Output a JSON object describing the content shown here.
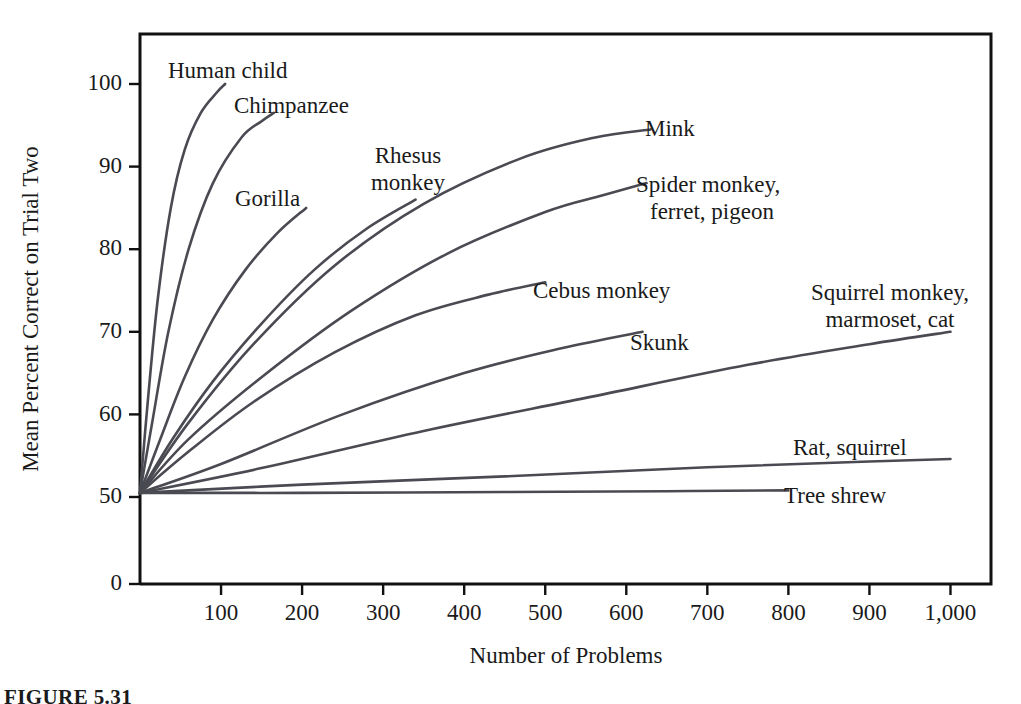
{
  "caption": "FIGURE 5.31",
  "chart_data": {
    "type": "line",
    "title": "",
    "xlabel": "Number of Problems",
    "ylabel": "Mean Percent Correct on Trial Two",
    "xlim": [
      0,
      1050
    ],
    "ylim": [
      0,
      103
    ],
    "grid": false,
    "legend_position": "inline-curve-labels",
    "x_ticks": [
      100,
      200,
      300,
      400,
      500,
      600,
      700,
      800,
      900,
      1000
    ],
    "x_tick_labels": [
      "100",
      "200",
      "300",
      "400",
      "500",
      "600",
      "700",
      "800",
      "900",
      "1,000"
    ],
    "y_ticks": [
      0,
      50,
      60,
      70,
      80,
      90,
      100
    ],
    "y_tick_labels": [
      "0",
      "50",
      "60",
      "70",
      "80",
      "90",
      "100"
    ],
    "common_origin": {
      "x": 0,
      "y": 50.5
    },
    "series": [
      {
        "name": "Human child",
        "label": "Human child",
        "label_lines": [
          "Human child"
        ],
        "label_anchor": "start",
        "label_x": 168,
        "label_y": 78,
        "points": [
          [
            0,
            50.5
          ],
          [
            10,
            62
          ],
          [
            22,
            74
          ],
          [
            38,
            85
          ],
          [
            55,
            92
          ],
          [
            75,
            96.5
          ],
          [
            95,
            99
          ],
          [
            105,
            100
          ]
        ]
      },
      {
        "name": "Chimpanzee",
        "label": "Chimpanzee",
        "label_lines": [
          "Chimpanzee"
        ],
        "label_anchor": "start",
        "label_x": 234,
        "label_y": 113,
        "points": [
          [
            0,
            50.5
          ],
          [
            15,
            59
          ],
          [
            35,
            70
          ],
          [
            60,
            80
          ],
          [
            90,
            88
          ],
          [
            125,
            93.5
          ],
          [
            150,
            95.5
          ],
          [
            165,
            96.5
          ]
        ]
      },
      {
        "name": "Gorilla",
        "label": "Gorilla",
        "label_lines": [
          "Gorilla"
        ],
        "label_anchor": "start",
        "label_x": 235,
        "label_y": 206,
        "points": [
          [
            0,
            50.5
          ],
          [
            25,
            57
          ],
          [
            55,
            64.5
          ],
          [
            90,
            71.5
          ],
          [
            130,
            77.5
          ],
          [
            170,
            82
          ],
          [
            205,
            85
          ]
        ]
      },
      {
        "name": "Rhesus monkey",
        "label": "Rhesus monkey",
        "label_lines": [
          "Rhesus",
          "monkey"
        ],
        "label_anchor": "middle",
        "label_x": 408,
        "label_y": 163,
        "points": [
          [
            0,
            50.5
          ],
          [
            40,
            57
          ],
          [
            90,
            64
          ],
          [
            150,
            71
          ],
          [
            215,
            77.5
          ],
          [
            280,
            82.5
          ],
          [
            340,
            86
          ]
        ]
      },
      {
        "name": "Mink",
        "label": "Mink",
        "label_lines": [
          "Mink"
        ],
        "label_anchor": "start",
        "label_x": 645,
        "label_y": 136,
        "points": [
          [
            0,
            50.5
          ],
          [
            60,
            59
          ],
          [
            140,
            68.5
          ],
          [
            240,
            78
          ],
          [
            350,
            85.5
          ],
          [
            470,
            91
          ],
          [
            560,
            93.5
          ],
          [
            630,
            94.5
          ]
        ]
      },
      {
        "name": "Spider monkey, ferret, pigeon",
        "label": "Spider monkey, ferret, pigeon",
        "label_lines": [
          "Spider monkey,",
          "ferret, pigeon"
        ],
        "label_anchor": "start",
        "label_x": 636,
        "label_y": 192,
        "points": [
          [
            0,
            50.5
          ],
          [
            60,
            57
          ],
          [
            150,
            64.5
          ],
          [
            260,
            72.5
          ],
          [
            380,
            79.5
          ],
          [
            500,
            84.5
          ],
          [
            570,
            86.5
          ],
          [
            625,
            88
          ]
        ]
      },
      {
        "name": "Cebus monkey",
        "label": "Cebus monkey",
        "label_lines": [
          "Cebus monkey"
        ],
        "label_anchor": "start",
        "label_x": 533,
        "label_y": 298,
        "points": [
          [
            0,
            50.5
          ],
          [
            60,
            55.5
          ],
          [
            140,
            61.5
          ],
          [
            240,
            67.5
          ],
          [
            340,
            72
          ],
          [
            430,
            74.5
          ],
          [
            500,
            76
          ]
        ]
      },
      {
        "name": "Skunk",
        "label": "Skunk",
        "label_lines": [
          "Skunk"
        ],
        "label_anchor": "start",
        "label_x": 630,
        "label_y": 350,
        "points": [
          [
            0,
            50.5
          ],
          [
            100,
            54
          ],
          [
            250,
            60
          ],
          [
            400,
            65
          ],
          [
            520,
            68
          ],
          [
            620,
            70
          ]
        ]
      },
      {
        "name": "Squirrel monkey, marmoset, cat",
        "label": "Squirrel monkey, marmoset, cat",
        "label_lines": [
          "Squirrel monkey,",
          "marmoset, cat"
        ],
        "label_anchor": "middle",
        "label_x": 890,
        "label_y": 300,
        "points": [
          [
            0,
            50.5
          ],
          [
            150,
            53.5
          ],
          [
            350,
            58
          ],
          [
            550,
            62
          ],
          [
            750,
            66
          ],
          [
            900,
            68.5
          ],
          [
            1000,
            70
          ]
        ]
      },
      {
        "name": "Rat, squirrel",
        "label": "Rat, squirrel",
        "label_lines": [
          "Rat, squirrel"
        ],
        "label_anchor": "start",
        "label_x": 793,
        "label_y": 455,
        "points": [
          [
            0,
            50.5
          ],
          [
            200,
            51.5
          ],
          [
            450,
            52.5
          ],
          [
            700,
            53.6
          ],
          [
            900,
            54.3
          ],
          [
            1000,
            54.6
          ]
        ]
      },
      {
        "name": "Tree shrew",
        "label": "Tree shrew",
        "label_lines": [
          "Tree shrew"
        ],
        "label_anchor": "start",
        "label_x": 784,
        "label_y": 503,
        "points": [
          [
            0,
            50.5
          ],
          [
            200,
            50.5
          ],
          [
            450,
            50.6
          ],
          [
            650,
            50.7
          ],
          [
            800,
            50.8
          ]
        ]
      }
    ]
  }
}
